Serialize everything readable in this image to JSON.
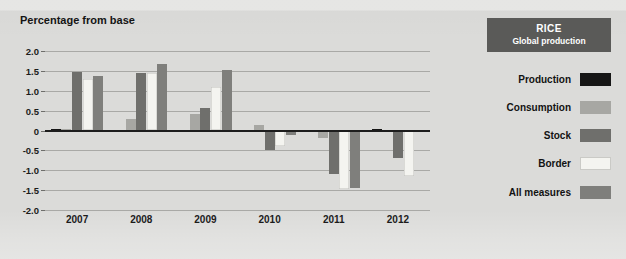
{
  "chart_title": "Percentage from base",
  "legend_panel": {
    "header_title": "RICE",
    "header_subtitle": "Global production",
    "items": [
      {
        "label": "Production",
        "color": "#161616"
      },
      {
        "label": "Consumption",
        "color": "#a7a7a3"
      },
      {
        "label": "Stock",
        "color": "#6f6f6c"
      },
      {
        "label": "Border",
        "color": "#f4f4f0"
      },
      {
        "label": "All measures",
        "color": "#7f7f7c"
      }
    ]
  },
  "axes": {
    "y_ticks": [
      "2.0",
      "1.5",
      "1.0",
      "0.5",
      "0",
      "-0.5",
      "-1.0",
      "-1.5",
      "-2.0"
    ],
    "y_tick_values": [
      2.0,
      1.5,
      1.0,
      0.5,
      0,
      -0.5,
      -1.0,
      -1.5,
      -2.0
    ],
    "x_labels": [
      "2007",
      "2008",
      "2009",
      "2010",
      "2011",
      "2012"
    ]
  },
  "chart_data": {
    "type": "bar",
    "title": "Percentage from base",
    "subtitle": "RICE — Global production",
    "xlabel": "",
    "ylabel": "Percentage from base",
    "ylim": [
      -2.0,
      2.0
    ],
    "grid": true,
    "legend_position": "right",
    "categories": [
      "2007",
      "2008",
      "2009",
      "2010",
      "2011",
      "2012"
    ],
    "series": [
      {
        "name": "Production",
        "color": "#161616",
        "values": [
          0.03,
          0.02,
          -0.05,
          -0.04,
          -0.05,
          0.03
        ]
      },
      {
        "name": "Consumption",
        "color": "#a7a7a3",
        "values": [
          0.05,
          0.3,
          0.42,
          0.13,
          -0.18,
          -0.05
        ]
      },
      {
        "name": "Stock",
        "color": "#6f6f6c",
        "values": [
          1.48,
          1.45,
          0.57,
          -0.48,
          -1.1,
          -0.7
        ]
      },
      {
        "name": "Border",
        "color": "#f4f4f0",
        "values": [
          1.3,
          1.45,
          1.1,
          -0.4,
          -1.48,
          -1.15
        ]
      },
      {
        "name": "All measures",
        "color": "#7f7f7c",
        "values": [
          1.36,
          1.68,
          1.52,
          -0.12,
          -1.45,
          -0.02
        ]
      }
    ]
  }
}
